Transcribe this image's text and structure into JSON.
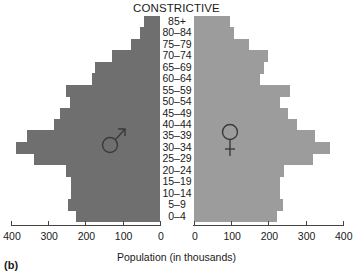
{
  "chart_data": {
    "type": "bar",
    "subtype": "population-pyramid",
    "title": "CONSTRICTIVE",
    "panel_label": "(b)",
    "xlabel": "Population (in thousands)",
    "ylabel": "",
    "categories": [
      "85+",
      "80–84",
      "75–79",
      "70–74",
      "65–69",
      "60–64",
      "55–59",
      "50–54",
      "45–49",
      "40–44",
      "35–39",
      "30–34",
      "25–29",
      "20–24",
      "15–19",
      "10–14",
      "5–9",
      "0–4"
    ],
    "series": [
      {
        "name": "Male",
        "symbol": "♂",
        "color": "#6f6f6f",
        "values": [
          43,
          54,
          78,
          130,
          176,
          184,
          254,
          243,
          270,
          286,
          357,
          386,
          338,
          254,
          240,
          240,
          246,
          227
        ]
      },
      {
        "name": "Female",
        "symbol": "♀",
        "color": "#9c9c9c",
        "values": [
          97,
          108,
          149,
          200,
          189,
          178,
          257,
          232,
          254,
          276,
          324,
          365,
          319,
          241,
          230,
          232,
          238,
          224
        ]
      }
    ],
    "xlim_left": [
      400,
      0
    ],
    "xlim_right": [
      0,
      400
    ],
    "left_ticks": [
      "400",
      "300",
      "200",
      "100",
      "0"
    ],
    "right_ticks": [
      "0",
      "100",
      "200",
      "300",
      "400"
    ],
    "grid": false,
    "legend": "symbols on bars (♂ left, ♀ right)"
  }
}
